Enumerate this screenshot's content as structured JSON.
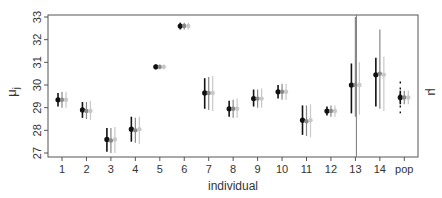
{
  "chart_data": {
    "type": "scatter",
    "subtype": "point-with-error-bars",
    "title": "",
    "xlabel": "individual",
    "ylabel": "μj",
    "ylabel_right": "μ",
    "ylim": [
      27,
      33
    ],
    "yticks": [
      27,
      28,
      29,
      30,
      31,
      32,
      33
    ],
    "categories": [
      "1",
      "2",
      "3",
      "4",
      "5",
      "6",
      "7",
      "8",
      "9",
      "10",
      "11",
      "12",
      "13",
      "14",
      "pop"
    ],
    "grid": false,
    "legend": null,
    "series": [
      {
        "name": "estimate-1",
        "color": "#111111",
        "values": [
          29.35,
          28.9,
          27.6,
          28.05,
          30.8,
          32.6,
          29.65,
          28.95,
          29.4,
          29.7,
          28.45,
          28.85,
          30.0,
          30.45,
          29.45
        ],
        "lower": [
          29.05,
          28.55,
          27.05,
          27.5,
          30.7,
          32.45,
          28.95,
          28.6,
          29.05,
          29.4,
          27.8,
          28.65,
          28.75,
          29.05,
          29.15
        ],
        "upper": [
          29.65,
          29.25,
          28.1,
          28.6,
          30.9,
          32.75,
          30.3,
          29.3,
          29.8,
          30.0,
          29.1,
          29.05,
          30.95,
          31.2,
          29.75
        ],
        "extra_lower": [
          null,
          null,
          null,
          null,
          null,
          null,
          null,
          null,
          null,
          null,
          null,
          null,
          null,
          null,
          28.75
        ],
        "extra_upper": [
          null,
          null,
          null,
          null,
          null,
          null,
          null,
          null,
          null,
          null,
          null,
          null,
          null,
          null,
          30.15
        ]
      },
      {
        "name": "estimate-2",
        "color": "#888888",
        "values": [
          29.35,
          28.85,
          27.55,
          28.0,
          30.8,
          32.6,
          29.65,
          28.95,
          29.4,
          29.7,
          28.4,
          28.85,
          30.0,
          30.5,
          29.45
        ],
        "lower": [
          29.0,
          28.5,
          27.0,
          27.45,
          30.7,
          32.45,
          28.9,
          28.55,
          29.0,
          29.35,
          27.75,
          28.6,
          28.6,
          28.95,
          29.15
        ],
        "upper": [
          29.7,
          29.25,
          28.1,
          28.55,
          30.9,
          32.75,
          30.35,
          29.35,
          29.8,
          30.05,
          29.1,
          29.1,
          33.0,
          32.45,
          29.75
        ]
      },
      {
        "name": "estimate-3",
        "color": "#c8c8c8",
        "values": [
          29.35,
          28.85,
          27.6,
          28.05,
          30.8,
          32.6,
          29.65,
          28.95,
          29.4,
          29.7,
          28.45,
          28.85,
          30.0,
          30.45,
          29.45
        ],
        "lower": [
          29.0,
          28.45,
          27.0,
          27.4,
          30.7,
          32.45,
          28.85,
          28.55,
          29.0,
          29.35,
          27.7,
          28.6,
          28.7,
          28.85,
          29.15
        ],
        "upper": [
          29.7,
          29.3,
          28.15,
          28.6,
          30.9,
          32.75,
          30.4,
          29.4,
          29.85,
          30.05,
          29.15,
          29.1,
          31.0,
          31.25,
          29.75
        ]
      }
    ],
    "annotations": [
      "vertical reference line at x=13"
    ]
  }
}
